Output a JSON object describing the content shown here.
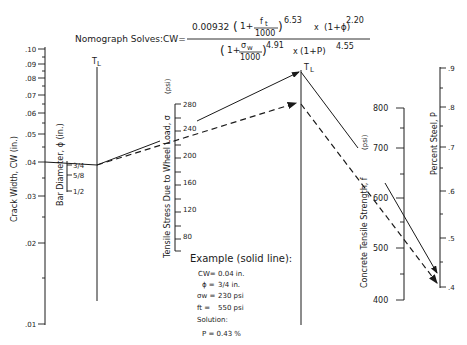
{
  "header": {
    "prefix": "Nomograph Solves:CW=",
    "numerator_const": "0.00932",
    "num_term1_open": "(1+",
    "num_ft": "f",
    "num_ft_sub": "t",
    "num_1000": "1000",
    "num_exp1": "6.53",
    "num_times": "x",
    "num_term2": "(1+ϕ)",
    "num_exp2": "2.20",
    "den_term1_open": "(1+",
    "den_sw": "σ",
    "den_sw_sub": "w",
    "den_1000": "1000",
    "den_exp1": "4.91",
    "den_times": "x",
    "den_term2": "(1+P)",
    "den_exp2": "4.55"
  },
  "axes": {
    "crack_width": {
      "label": "Crack Width, CW (in.)",
      "ticks": [
        ".10",
        ".09",
        ".08",
        ".07",
        ".06",
        ".05",
        ".04",
        ".03",
        ".02",
        ".01"
      ]
    },
    "bar_diameter": {
      "label": "Bar Diameter, ϕ (in.)",
      "ticks": [
        "3/4",
        "5/8",
        "1/2"
      ]
    },
    "turning_line_1": {
      "label": "T",
      "sub": "L"
    },
    "tensile_stress": {
      "label": "Tensile Stress Due to Wheel Load, σ",
      "label_sub": "w",
      "label_unit": "(psi)",
      "ticks": [
        "280",
        "240",
        "200",
        "160",
        "120",
        "80"
      ]
    },
    "turning_line_2": {
      "label": "T",
      "sub": "L"
    },
    "concrete_strength": {
      "label": "Concrete Tensile Strength, f",
      "label_sub": "t",
      "label_unit": "(psi)",
      "ticks": [
        "800",
        "700",
        "600",
        "500",
        "400"
      ]
    },
    "percent_steel": {
      "label": "Percent Steel, P",
      "ticks": [
        ".9",
        ".8",
        ".7",
        ".6",
        ".5",
        ".4"
      ]
    }
  },
  "example": {
    "title": "Example (solid line):",
    "lines": [
      {
        "key": "CW=",
        "value": "0.04 in."
      },
      {
        "key": "ϕ =",
        "value": "3/4 in."
      },
      {
        "key": "σw =",
        "value": "230 psi"
      },
      {
        "key": "ft =",
        "value": "550 psi"
      }
    ],
    "solution_label": "Solution:",
    "solution": "P = 0.43 %"
  }
}
